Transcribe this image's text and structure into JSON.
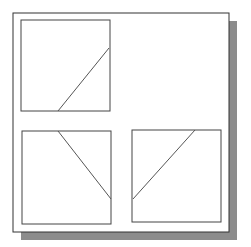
{
  "figure": {
    "colors": {
      "background": "#ffffff",
      "frame": "#333333",
      "shadow": "#8c8c8c",
      "line": "#444444"
    },
    "panels": [
      {
        "id": "top-left",
        "line": "from bottom-middle to right side, rising"
      },
      {
        "id": "bottom-left",
        "line": "from top-middle to right side, descending"
      },
      {
        "id": "bottom-right",
        "line": "from top to left side, descending"
      }
    ]
  }
}
